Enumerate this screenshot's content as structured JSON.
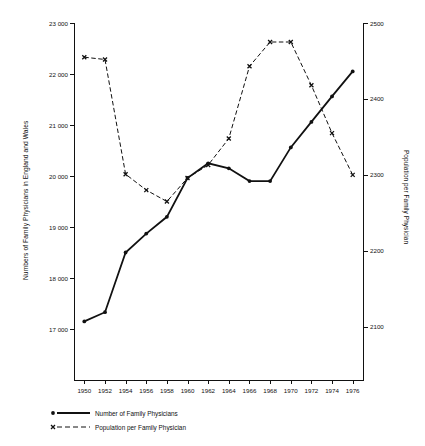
{
  "chart_data": {
    "type": "line",
    "title": "",
    "xlabel": "",
    "x": [
      1950,
      1952,
      1954,
      1956,
      1958,
      1960,
      1962,
      1964,
      1966,
      1968,
      1970,
      1972,
      1974,
      1976
    ],
    "xtick_labels": [
      "1950",
      "1952",
      "1954",
      "1956",
      "1958",
      "1960",
      "1962",
      "1964",
      "1966",
      "1968",
      "1970",
      "1972",
      "1974",
      "1976"
    ],
    "xlim": [
      1949,
      1977
    ],
    "grid": false,
    "legend_position": "below-left",
    "axes": {
      "left": {
        "label": "Numbers of Family Physicians in England and Wales",
        "ticks": [
          17000,
          18000,
          19000,
          20000,
          21000,
          22000,
          23000
        ],
        "tick_labels": [
          "17 000",
          "18 000",
          "19 000",
          "20 000",
          "21 000",
          "22 000",
          "23 000"
        ],
        "ylim": [
          16000,
          23000
        ]
      },
      "right": {
        "label": "Population per Family Physician",
        "ticks": [
          2100,
          2200,
          2300,
          2400,
          2500
        ],
        "tick_labels": [
          "2100",
          "2200",
          "2300",
          "2400",
          "2500"
        ],
        "ylim": [
          2030,
          2500
        ]
      }
    },
    "series": [
      {
        "name": "Number of Family Physicians",
        "axis": "left",
        "marker": "dot",
        "line_style": "solid",
        "color": "#111111",
        "x": [
          1950,
          1952,
          1954,
          1956,
          1958,
          1960,
          1962,
          1964,
          1966,
          1968,
          1970,
          1972,
          1974,
          1976
        ],
        "values": [
          17150,
          17330,
          18500,
          18870,
          19200,
          19960,
          20250,
          20150,
          19900,
          19900,
          20560,
          21060,
          21560,
          22050
        ]
      },
      {
        "name": "Population per Family Physician",
        "axis": "right",
        "marker": "x",
        "line_style": "dashed",
        "color": "#111111",
        "x": [
          1950,
          1952,
          1954,
          1956,
          1958,
          1960,
          1962,
          1964,
          1966,
          1968,
          1970,
          1972,
          1974,
          1976
        ],
        "values": [
          2455,
          2452,
          2301,
          2280,
          2265,
          2296,
          2313,
          2348,
          2443,
          2475,
          2475,
          2418,
          2355,
          2300
        ]
      }
    ]
  },
  "legend": {
    "entries": [
      {
        "label": "Number of Family Physicians",
        "marker": "dot",
        "style": "solid"
      },
      {
        "label": "Population per Family Physician",
        "marker": "x",
        "style": "dashed"
      }
    ]
  }
}
